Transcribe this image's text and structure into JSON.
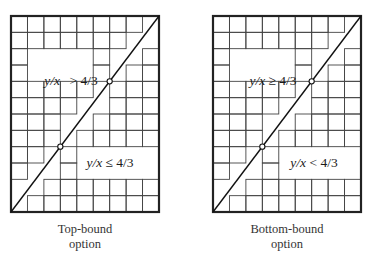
{
  "figure": {
    "grid": {
      "columns": 9,
      "rows": 12,
      "line_color": "#444444",
      "border_color": "#222222"
    },
    "diagonal": {
      "ratio": "4/3",
      "marked_points": [
        [
          3,
          4
        ],
        [
          6,
          8
        ]
      ]
    },
    "panels": [
      {
        "id": "top-bound",
        "upper_label": {
          "var": "y/x",
          "op": ">",
          "value": "4/3"
        },
        "lower_label": {
          "var": "y/x",
          "op": "≤",
          "value": "4/3"
        },
        "caption_line1": "Top-bound",
        "caption_line2": "option"
      },
      {
        "id": "bottom-bound",
        "upper_label": {
          "var": "y/x",
          "op": "≥",
          "value": "4/3"
        },
        "lower_label": {
          "var": "y/x",
          "op": "<",
          "value": "4/3"
        },
        "caption_line1": "Bottom-bound",
        "caption_line2": "option"
      }
    ]
  }
}
